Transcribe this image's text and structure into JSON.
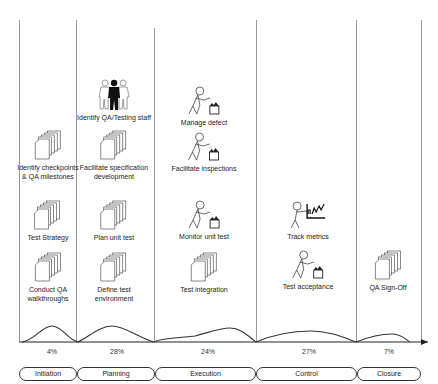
{
  "phases": [
    {
      "name": "Initiation",
      "percent": "4%"
    },
    {
      "name": "Planning",
      "percent": "28%"
    },
    {
      "name": "Execution",
      "percent": "24%"
    },
    {
      "name": "Control",
      "percent": "27%"
    },
    {
      "name": "Closure",
      "percent": "7%"
    }
  ],
  "activities": {
    "initiation": [
      {
        "label1": "Identify checkpoints",
        "label2": "& QA milestones",
        "icon": "documents-icon"
      },
      {
        "label1": "Test Strategy",
        "label2": "",
        "icon": "documents-icon"
      },
      {
        "label1": "Conduct QA",
        "label2": "walkthroughs",
        "icon": "documents-icon"
      }
    ],
    "planning": [
      {
        "label1": "Identify QA/Testing staff",
        "label2": "",
        "icon": "team-icon"
      },
      {
        "label1": "Facilitate specification",
        "label2": "development",
        "icon": "documents-icon"
      },
      {
        "label1": "Plan unit test",
        "label2": "",
        "icon": "documents-icon"
      },
      {
        "label1": "Define test",
        "label2": "environment",
        "icon": "documents-icon"
      }
    ],
    "execution": [
      {
        "label1": "Manage defect",
        "label2": "",
        "icon": "worker-bin-icon"
      },
      {
        "label1": "Facilitate inspections",
        "label2": "",
        "icon": "worker-bin-icon"
      },
      {
        "label1": "Monitor unit test",
        "label2": "",
        "icon": "worker-bin-icon"
      },
      {
        "label1": "Test integration",
        "label2": "",
        "icon": "documents-icon"
      }
    ],
    "control": [
      {
        "label1": "Track metrics",
        "label2": "",
        "icon": "worker-chart-icon"
      },
      {
        "label1": "Test acceptance",
        "label2": "",
        "icon": "worker-bin-icon"
      }
    ],
    "closure": [
      {
        "label1": "QA Sign-Off",
        "label2": "",
        "icon": "documents-icon"
      }
    ]
  }
}
